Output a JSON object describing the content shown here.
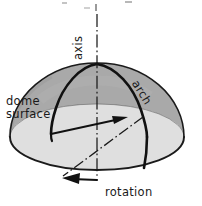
{
  "figure": {
    "kind": "technical-line-diagram",
    "subject": "dome",
    "background_color": "#ffffff",
    "labels": {
      "axis": "axis",
      "arch": "arch",
      "dome_surface_line1": "dome",
      "dome_surface_line2": "surface",
      "rotation": "rotation"
    },
    "colors": {
      "dome_surface_fill": "#a9a9a9",
      "base_ellipse_fill": "#e2e2e2",
      "outline": "#1a1a1a",
      "text": "#1a1a1a",
      "shadow_edge": "#8f8f8f"
    },
    "geometry": {
      "apex_x": 97,
      "apex_y": 63,
      "base_center_x": 97,
      "base_center_y": 137,
      "base_radius_x": 87,
      "base_radius_y": 33,
      "dome_height": 74
    },
    "annotations": {
      "axis_line_style": "dash-dot",
      "rotation_line_style": "dash-dot",
      "radius_arrow_direction": "right",
      "rotation_arrow_direction": "left"
    }
  }
}
